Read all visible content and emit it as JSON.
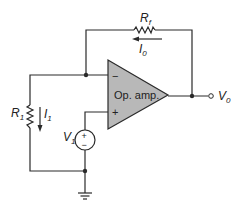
{
  "diagram": {
    "type": "circuit-schematic",
    "components": {
      "op_amp": {
        "label": "Op. amp.",
        "inverting_sign": "−",
        "noninverting_sign": "+",
        "fill": "#b8b8b8"
      },
      "feedback_resistor": {
        "label": "R",
        "subscript": "f"
      },
      "input_resistor": {
        "label": "R",
        "subscript": "1"
      },
      "source": {
        "label": "V",
        "subscript": "1",
        "plus": "+",
        "minus": "−"
      },
      "output": {
        "label": "V",
        "subscript": "0"
      },
      "feedback_current": {
        "label": "I",
        "subscript": "0"
      },
      "input_current": {
        "label": "I",
        "subscript": "1"
      }
    },
    "wire_color": "#2a2a2a"
  }
}
